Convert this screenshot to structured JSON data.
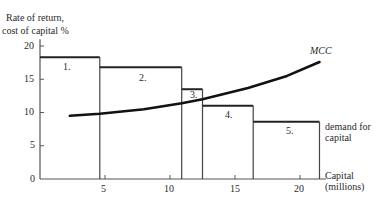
{
  "chart_data": {
    "type": "step+line",
    "title": "",
    "ylabel": "Rate of return, cost of capital %",
    "ylabel_lines": [
      "Rate of return,",
      "cost of capital %"
    ],
    "xlabel": "Capital (millions)",
    "xlabel_lines": [
      "Capital",
      "(millions)"
    ],
    "xlim": [
      0,
      22
    ],
    "ylim": [
      0,
      21
    ],
    "x_ticks": [
      5,
      10,
      15,
      20
    ],
    "y_ticks": [
      0,
      5,
      10,
      15,
      20
    ],
    "grid": false,
    "series": [
      {
        "name": "demand for capital",
        "label_lines": [
          "demand for",
          "capital"
        ],
        "type": "step",
        "bars": [
          {
            "label": "1.",
            "x_start": 0,
            "x_end": 4.6,
            "rate": 18.3
          },
          {
            "label": "2.",
            "x_start": 4.6,
            "x_end": 10.9,
            "rate": 16.8
          },
          {
            "label": "3.",
            "x_start": 10.9,
            "x_end": 12.5,
            "rate": 13.5
          },
          {
            "label": "4.",
            "x_start": 12.5,
            "x_end": 16.4,
            "rate": 11.0
          },
          {
            "label": "5.",
            "x_start": 16.4,
            "x_end": 21.5,
            "rate": 8.6
          }
        ]
      },
      {
        "name": "MCC",
        "type": "line",
        "x": [
          2.3,
          4.6,
          8.0,
          10.9,
          12.5,
          16.0,
          19.0,
          21.5
        ],
        "y": [
          9.5,
          9.8,
          10.5,
          11.4,
          12.0,
          13.7,
          15.5,
          17.6
        ]
      }
    ]
  }
}
